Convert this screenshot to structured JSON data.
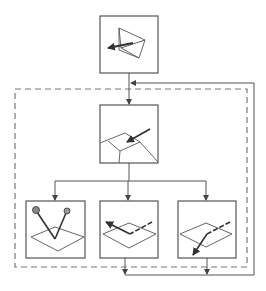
{
  "diagram": {
    "kind": "flowchart",
    "title": "",
    "colors": {
      "background": "#ffffff",
      "stroke": "#555555",
      "box_stroke": "#666666",
      "dashed": "#777777",
      "marker_fill": "#888888"
    },
    "nodes": [
      {
        "id": "top",
        "description": "camera/view frustum with arrow pointing left",
        "icon": "frustum-icon"
      },
      {
        "id": "middle",
        "description": "plane with arrow pointing into a surface point",
        "icon": "surface-hit-icon"
      },
      {
        "id": "bottom-left",
        "description": "plane with two rays reflecting to two spheres",
        "icon": "reflection-icon"
      },
      {
        "id": "bottom-middle",
        "description": "plane with arrow reflected to the left",
        "icon": "specular-reflection-icon"
      },
      {
        "id": "bottom-right",
        "description": "plane with arrow refracted downward through surface",
        "icon": "refraction-icon"
      }
    ],
    "edges": [
      {
        "from": "top",
        "to": "middle"
      },
      {
        "from": "middle",
        "to": "bottom-left"
      },
      {
        "from": "middle",
        "to": "bottom-middle"
      },
      {
        "from": "middle",
        "to": "bottom-right"
      },
      {
        "from": "bottom-middle",
        "to": "loop-back"
      },
      {
        "from": "bottom-right",
        "to": "loop-back"
      },
      {
        "from": "loop-back",
        "to": "middle",
        "style": "feedback"
      }
    ],
    "group": {
      "style": "dashed",
      "contains": [
        "middle",
        "bottom-left",
        "bottom-middle",
        "bottom-right"
      ]
    }
  }
}
